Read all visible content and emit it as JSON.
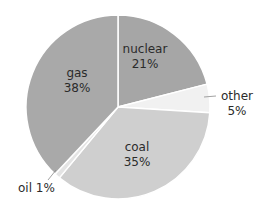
{
  "chart_data": {
    "type": "pie",
    "title": "",
    "start_angle_deg": 0,
    "direction": "clockwise",
    "categories": [
      "nuclear",
      "other",
      "coal",
      "oil",
      "gas"
    ],
    "values": [
      21,
      5,
      35,
      1,
      38
    ],
    "labels": [
      {
        "name": "nuclear",
        "pct": "21%"
      },
      {
        "name": "other",
        "pct": "5%"
      },
      {
        "name": "coal",
        "pct": "35%"
      },
      {
        "name": "oil",
        "pct": "1%"
      },
      {
        "name": "gas",
        "pct": "38%"
      }
    ],
    "colors": [
      "#a6a6a6",
      "#f1f1f1",
      "#cfcfcf",
      "#e4e4e4",
      "#a9a9a9"
    ],
    "separator_color": "#ffffff",
    "legend": "none",
    "units": "%"
  },
  "labels": {
    "nuclear": {
      "name": "nuclear",
      "pct": "21%"
    },
    "other": {
      "name": "other",
      "pct": "5%"
    },
    "coal": {
      "name": "coal",
      "pct": "35%"
    },
    "oil": {
      "text": "oil 1%"
    },
    "gas": {
      "name": "gas",
      "pct": "38%"
    }
  }
}
